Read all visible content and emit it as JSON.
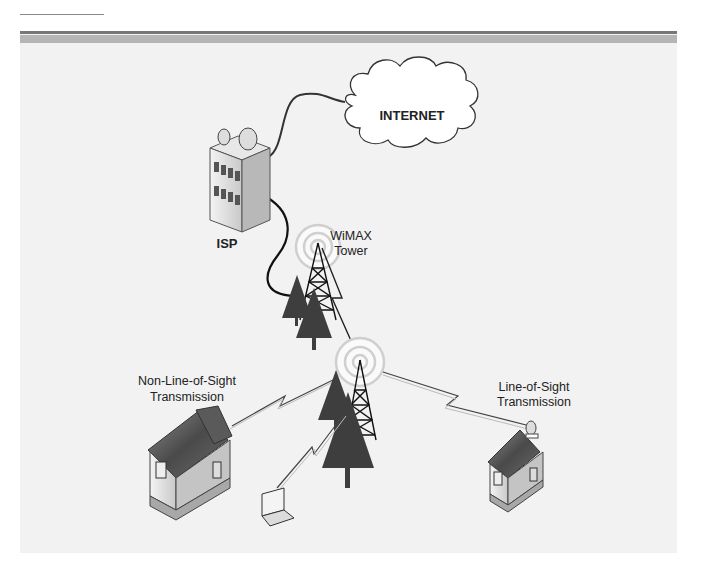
{
  "diagram": {
    "nodes": {
      "internet": {
        "label": "INTERNET"
      },
      "isp": {
        "label": "ISP"
      },
      "tower_main": {
        "label_line1": "WiMAX",
        "label_line2": "Tower"
      },
      "nlos": {
        "label_line1": "Non-Line-of-Sight",
        "label_line2": "Transmission"
      },
      "los": {
        "label_line1": "Line-of-Sight",
        "label_line2": "Transmission"
      }
    },
    "edges": [
      {
        "from": "isp",
        "to": "internet",
        "type": "wired"
      },
      {
        "from": "isp",
        "to": "tower_main",
        "type": "wired"
      },
      {
        "from": "tower_main",
        "to": "tower_relay",
        "type": "wireless"
      },
      {
        "from": "tower_relay",
        "to": "nlos_house",
        "type": "wireless"
      },
      {
        "from": "tower_relay",
        "to": "laptop",
        "type": "wireless"
      },
      {
        "from": "tower_relay",
        "to": "los_house",
        "type": "wireless"
      }
    ]
  },
  "colors": {
    "panel": "#f2f2f2",
    "band_dark": "#777777",
    "band_light": "#b5b5b5",
    "tree": "#3e3e3e",
    "line": "#1a1a1a"
  }
}
